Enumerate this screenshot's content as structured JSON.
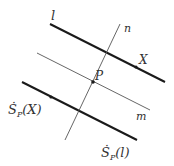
{
  "diagram": {
    "type": "geometry-reflection",
    "lines": [
      {
        "id": "l",
        "label": "l",
        "x1": 50,
        "y1": 24,
        "x2": 165,
        "y2": 82,
        "weight": "thick"
      },
      {
        "id": "m",
        "label": "m",
        "x1": 37,
        "y1": 53,
        "x2": 150,
        "y2": 110,
        "weight": "thin"
      },
      {
        "id": "sp_l",
        "label": "Ṡ",
        "label_sub": "P",
        "label_arg": "(l)",
        "x1": 22,
        "y1": 82,
        "x2": 137,
        "y2": 140,
        "weight": "thick"
      },
      {
        "id": "n",
        "label": "n",
        "x1": 120,
        "y1": 24,
        "x2": 65,
        "y2": 140,
        "weight": "thin"
      }
    ],
    "points": [
      {
        "id": "P",
        "label": "P",
        "x": 93,
        "y": 82
      },
      {
        "id": "X",
        "label": "X",
        "x": 136,
        "y": 67
      },
      {
        "id": "sp_X",
        "label": "Ṡ",
        "label_sub": "P",
        "label_arg": "(X)",
        "x": 51,
        "y": 97
      }
    ],
    "labels": {
      "l": "l",
      "n": "n",
      "m": "m",
      "P": "P",
      "X": "X",
      "sp_X_main": "Ṡ",
      "sp_X_sub": "P",
      "sp_X_arg": "(X)",
      "sp_l_main": "Ṡ",
      "sp_l_sub": "P",
      "sp_l_arg": "(l)"
    },
    "colors": {
      "stroke": "#1a1a1a",
      "thin_stroke": "#555555",
      "text": "#333333"
    }
  }
}
